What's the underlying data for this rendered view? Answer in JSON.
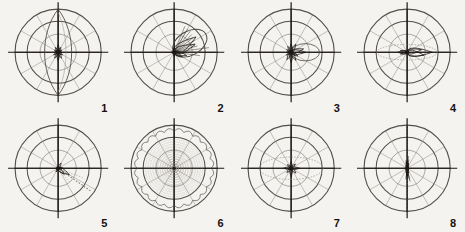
{
  "figure": {
    "title": "",
    "background_color": "#f4f3f0",
    "ink_color": "#1a1714",
    "grid_color": "#4a4640",
    "faint_color": "#8d8880",
    "rows": 2,
    "columns": 4
  },
  "chart_data": {
    "type": "line",
    "subtype": "polar-rose-diagram-panel",
    "title": "",
    "xlabel": "",
    "ylabel": "",
    "panel_count": 8,
    "shared_grid": {
      "circles": 3,
      "circle_radii_fraction": [
        0.42,
        0.72,
        1.0
      ],
      "spokes": 12,
      "spoke_step_degrees": 30,
      "axis_cross": true,
      "grid": true,
      "legend": "none",
      "tick_labels": [],
      "rlim": [
        0,
        1
      ]
    },
    "panels": [
      {
        "label": "1",
        "index": 1,
        "description": "Central rosette of short petals with a tall narrow vertical lens spanning the full diameter",
        "lobes": [
          {
            "angle_deg": 90,
            "radius": 0.18
          },
          {
            "angle_deg": 60,
            "radius": 0.13
          },
          {
            "angle_deg": 120,
            "radius": 0.13
          },
          {
            "angle_deg": 30,
            "radius": 0.1
          },
          {
            "angle_deg": 150,
            "radius": 0.1
          },
          {
            "angle_deg": 0,
            "radius": 0.09
          },
          {
            "angle_deg": 180,
            "radius": 0.09
          },
          {
            "angle_deg": 210,
            "radius": 0.12
          },
          {
            "angle_deg": 240,
            "radius": 0.16
          },
          {
            "angle_deg": 270,
            "radius": 0.2
          },
          {
            "angle_deg": 300,
            "radius": 0.16
          },
          {
            "angle_deg": 330,
            "radius": 0.12
          }
        ],
        "envelope": {
          "shape": "vertical-lens",
          "axis_deg": 90,
          "major": 1.0,
          "minor": 0.22
        }
      },
      {
        "label": "2",
        "index": 2,
        "description": "Compact dark core with a fan of rays to the right and a large loop bulging to the upper right",
        "lobes": [
          {
            "angle_deg": 0,
            "radius": 0.12
          },
          {
            "angle_deg": 20,
            "radius": 0.52
          },
          {
            "angle_deg": 35,
            "radius": 0.62
          },
          {
            "angle_deg": 345,
            "radius": 0.3
          },
          {
            "angle_deg": 330,
            "radius": 0.22
          },
          {
            "angle_deg": 90,
            "radius": 0.1
          },
          {
            "angle_deg": 270,
            "radius": 0.1
          },
          {
            "angle_deg": 180,
            "radius": 0.07
          }
        ],
        "envelope": {
          "shape": "offset-loop",
          "axis_deg": 30,
          "major": 0.78,
          "minor": 0.45
        }
      },
      {
        "label": "3",
        "index": 3,
        "description": "Star-shaped core with petals in all directions and a broad flat lobe toward the right",
        "lobes": [
          {
            "angle_deg": 0,
            "radius": 0.34
          },
          {
            "angle_deg": 15,
            "radius": 0.3
          },
          {
            "angle_deg": 60,
            "radius": 0.22
          },
          {
            "angle_deg": 90,
            "radius": 0.2
          },
          {
            "angle_deg": 120,
            "radius": 0.16
          },
          {
            "angle_deg": 150,
            "radius": 0.12
          },
          {
            "angle_deg": 180,
            "radius": 0.11
          },
          {
            "angle_deg": 210,
            "radius": 0.13
          },
          {
            "angle_deg": 240,
            "radius": 0.2
          },
          {
            "angle_deg": 270,
            "radius": 0.24
          },
          {
            "angle_deg": 300,
            "radius": 0.22
          },
          {
            "angle_deg": 330,
            "radius": 0.18
          }
        ],
        "envelope": {
          "shape": "right-lobe",
          "axis_deg": 0,
          "major": 0.66,
          "minor": 0.4
        }
      },
      {
        "label": "4",
        "index": 4,
        "description": "Dense dark wedge pointing left of centre with a faint horizontal streak trailing to the right",
        "lobes": [
          {
            "angle_deg": 180,
            "radius": 0.22
          },
          {
            "angle_deg": 165,
            "radius": 0.16
          },
          {
            "angle_deg": 195,
            "radius": 0.16
          },
          {
            "angle_deg": 0,
            "radius": 0.58
          },
          {
            "angle_deg": 350,
            "radius": 0.4
          },
          {
            "angle_deg": 10,
            "radius": 0.34
          }
        ],
        "envelope": {
          "shape": "horizontal-lens",
          "axis_deg": 0,
          "major": 0.7,
          "minor": 0.18
        }
      },
      {
        "label": "5",
        "index": 5,
        "description": "Small dark blot at centre with a dotted streak running to the lower right and a faint arc near the rim",
        "lobes": [
          {
            "angle_deg": 0,
            "radius": 0.12
          },
          {
            "angle_deg": 330,
            "radius": 0.3
          },
          {
            "angle_deg": 315,
            "radius": 0.2
          },
          {
            "angle_deg": 60,
            "radius": 0.14
          },
          {
            "angle_deg": 240,
            "radius": 0.1
          }
        ],
        "envelope": {
          "shape": "diagonal-streak",
          "axis_deg": -35,
          "major": 0.92,
          "minor": 0.1
        }
      },
      {
        "label": "6",
        "index": 6,
        "description": "Whole disc filled with fine dotted radial rays and scalloped arcs just inside the outer circle; tiny dot at centre",
        "lobes": [],
        "envelope": {
          "shape": "full-dotted-disc",
          "axis_deg": 0,
          "major": 1.0,
          "minor": 1.0
        }
      },
      {
        "label": "7",
        "index": 7,
        "description": "Dark starburst core with dotted spokes and a faint horizontal lens through the middle ring",
        "lobes": [
          {
            "angle_deg": 0,
            "radius": 0.2
          },
          {
            "angle_deg": 180,
            "radius": 0.18
          },
          {
            "angle_deg": 90,
            "radius": 0.16
          },
          {
            "angle_deg": 270,
            "radius": 0.2
          },
          {
            "angle_deg": 45,
            "radius": 0.14
          },
          {
            "angle_deg": 135,
            "radius": 0.12
          },
          {
            "angle_deg": 225,
            "radius": 0.14
          },
          {
            "angle_deg": 315,
            "radius": 0.16
          }
        ],
        "envelope": {
          "shape": "horizontal-lens",
          "axis_deg": 0,
          "major": 0.74,
          "minor": 0.26
        }
      },
      {
        "label": "8",
        "index": 8,
        "description": "Narrow vertical dark smudge at the centre with faint dotted vertical spokes; otherwise empty grid",
        "lobes": [
          {
            "angle_deg": 90,
            "radius": 0.18
          },
          {
            "angle_deg": 270,
            "radius": 0.18
          },
          {
            "angle_deg": 75,
            "radius": 0.12
          },
          {
            "angle_deg": 285,
            "radius": 0.12
          }
        ],
        "envelope": {
          "shape": "vertical-smudge",
          "axis_deg": 90,
          "major": 0.3,
          "minor": 0.08
        }
      }
    ]
  }
}
